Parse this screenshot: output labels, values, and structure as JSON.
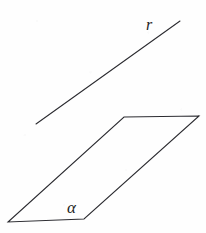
{
  "figure": {
    "background_color": "#fefefe",
    "stroke_color": "#2b2b30",
    "label_color": "#1f1f24",
    "width": 206,
    "height": 233,
    "line_r": {
      "name": "r",
      "label": "r",
      "x1": 36,
      "y1": 124,
      "x2": 180,
      "y2": 21,
      "label_x": 146,
      "label_y": 17
    },
    "plane_alpha": {
      "name": "alpha",
      "label": "α",
      "points": "124,117 199,116 84,219 8,222",
      "vertices": [
        {
          "name": "top-left",
          "x": 124,
          "y": 117
        },
        {
          "name": "top-right",
          "x": 199,
          "y": 116
        },
        {
          "name": "bottom-right",
          "x": 84,
          "y": 219
        },
        {
          "name": "bottom-left",
          "x": 8,
          "y": 222
        }
      ],
      "label_x": 67,
      "label_y": 199
    }
  }
}
